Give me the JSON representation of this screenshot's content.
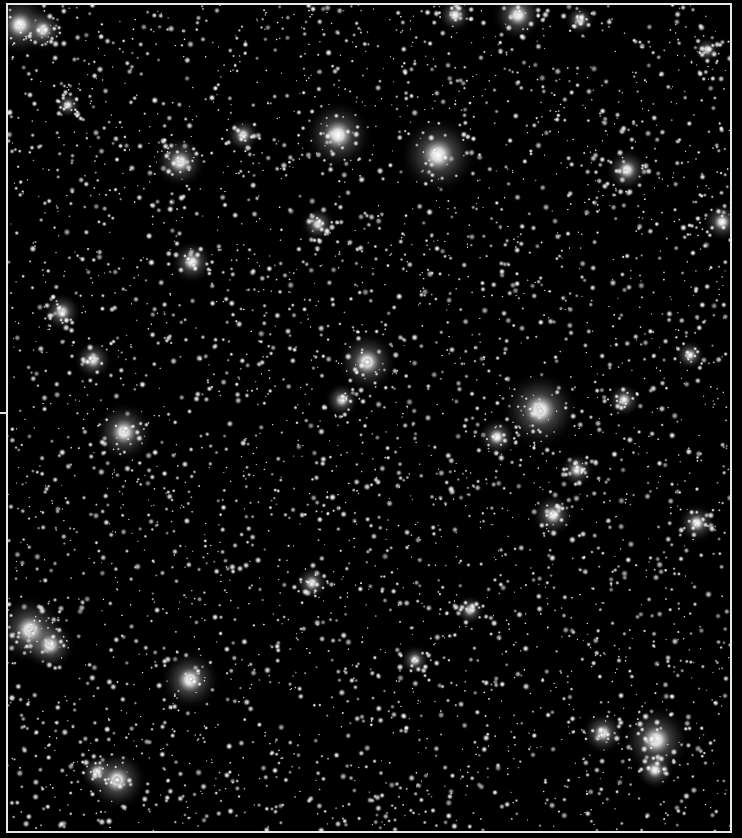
{
  "image": {
    "subject": "Dense star field",
    "description": "Black-and-white astronomical photograph of a crowded star field framed by a thin white border",
    "colors": {
      "background": "#000000",
      "frame": "#e8e8e8",
      "star_core": "#ffffff",
      "star_halo": "#bfbfbf"
    },
    "frame": {
      "left": 6,
      "top": 3,
      "width": 726,
      "height": 830
    },
    "left_tick_y": 412,
    "faint_star_count": 4200,
    "faint_seed": 7,
    "bright_stars": [
      {
        "x": 20,
        "y": 25,
        "r": 14
      },
      {
        "x": 43,
        "y": 30,
        "r": 10
      },
      {
        "x": 518,
        "y": 15,
        "r": 12
      },
      {
        "x": 455,
        "y": 15,
        "r": 8
      },
      {
        "x": 338,
        "y": 135,
        "r": 16
      },
      {
        "x": 438,
        "y": 155,
        "r": 18
      },
      {
        "x": 180,
        "y": 162,
        "r": 12
      },
      {
        "x": 627,
        "y": 170,
        "r": 10
      },
      {
        "x": 722,
        "y": 222,
        "r": 9
      },
      {
        "x": 192,
        "y": 262,
        "r": 10
      },
      {
        "x": 318,
        "y": 224,
        "r": 8
      },
      {
        "x": 62,
        "y": 312,
        "r": 9
      },
      {
        "x": 93,
        "y": 360,
        "r": 9
      },
      {
        "x": 367,
        "y": 362,
        "r": 14
      },
      {
        "x": 540,
        "y": 410,
        "r": 18
      },
      {
        "x": 124,
        "y": 432,
        "r": 14
      },
      {
        "x": 497,
        "y": 437,
        "r": 9
      },
      {
        "x": 624,
        "y": 400,
        "r": 8
      },
      {
        "x": 342,
        "y": 400,
        "r": 8
      },
      {
        "x": 577,
        "y": 470,
        "r": 8
      },
      {
        "x": 553,
        "y": 515,
        "r": 10
      },
      {
        "x": 697,
        "y": 523,
        "r": 9
      },
      {
        "x": 30,
        "y": 630,
        "r": 16
      },
      {
        "x": 50,
        "y": 645,
        "r": 12
      },
      {
        "x": 190,
        "y": 680,
        "r": 14
      },
      {
        "x": 656,
        "y": 740,
        "r": 16
      },
      {
        "x": 603,
        "y": 733,
        "r": 10
      },
      {
        "x": 117,
        "y": 780,
        "r": 14
      },
      {
        "x": 97,
        "y": 772,
        "r": 8
      },
      {
        "x": 655,
        "y": 770,
        "r": 9
      },
      {
        "x": 312,
        "y": 583,
        "r": 8
      },
      {
        "x": 470,
        "y": 610,
        "r": 7
      },
      {
        "x": 243,
        "y": 135,
        "r": 8
      },
      {
        "x": 580,
        "y": 20,
        "r": 7
      },
      {
        "x": 690,
        "y": 355,
        "r": 7
      },
      {
        "x": 415,
        "y": 660,
        "r": 7
      },
      {
        "x": 707,
        "y": 50,
        "r": 6
      },
      {
        "x": 68,
        "y": 105,
        "r": 6
      }
    ]
  }
}
